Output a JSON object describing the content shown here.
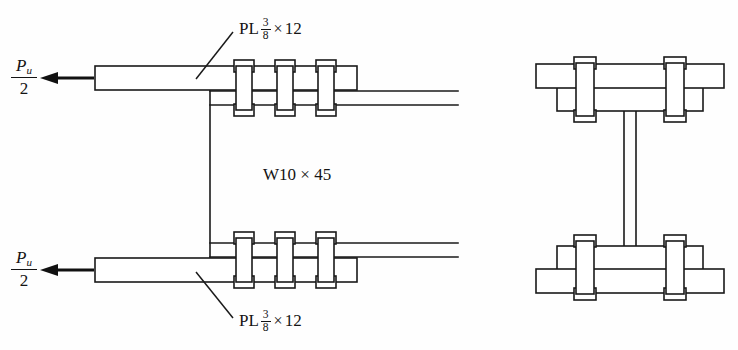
{
  "figure": {
    "view_left_name": "elevation-view",
    "view_right_name": "section-view",
    "background_color": "#fefefe",
    "line_color": "#1a1a1a"
  },
  "labels": {
    "plate_top": {
      "prefix": "PL",
      "fraction_numerator": "3",
      "fraction_denominator": "8",
      "times": "×",
      "width": "12",
      "full_text": "PL 3/8 × 12"
    },
    "plate_bottom": {
      "prefix": "PL",
      "fraction_numerator": "3",
      "fraction_denominator": "8",
      "times": "×",
      "width": "12",
      "full_text": "PL 3/8 × 12"
    },
    "member": {
      "text": "W10 × 45",
      "designation": "W10",
      "times": "×",
      "weight": "45"
    },
    "load_top": {
      "symbol": "P",
      "subscript": "u",
      "denominator": "2",
      "full_text": "Pu/2"
    },
    "load_bottom": {
      "symbol": "P",
      "subscript": "u",
      "denominator": "2",
      "full_text": "Pu/2"
    }
  },
  "geometry": {
    "bolts_per_plate_elevation": 3,
    "bolts_per_flange_section": 2,
    "flange_plates": 2
  }
}
